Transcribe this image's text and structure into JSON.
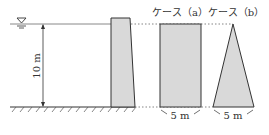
{
  "diagram": {
    "water_depth_label": "10 m",
    "case_a_label": "ケース（a）",
    "case_b_label": "ケース（b）",
    "case_a_width_label": "5 m",
    "case_b_width_label": "5 m",
    "water_surface_symbol": "∇",
    "colors": {
      "fill": "#d9d9d9",
      "stroke": "#333333",
      "water_line": "#888888"
    }
  }
}
